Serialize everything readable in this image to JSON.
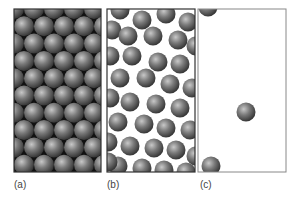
{
  "figure": {
    "panels": [
      {
        "id": "a",
        "label": "(a)",
        "state": "solid",
        "arrangement": "close-packed hexagonal lattice"
      },
      {
        "id": "b",
        "label": "(b)",
        "state": "liquid",
        "arrangement": "closely spaced, disordered"
      },
      {
        "id": "c",
        "label": "(c)",
        "state": "gas",
        "arrangement": "sparse, widely separated",
        "particle_count_visible": 3
      }
    ],
    "colors": {
      "background": "#ffffff",
      "panel_border_dark": "#333333",
      "panel_border_light": "#888888",
      "sphere_highlight": "#c8c8c8",
      "sphere_mid": "#6e6e6e",
      "sphere_shadow": "#2e2e2e",
      "label_text": "#444444"
    }
  }
}
